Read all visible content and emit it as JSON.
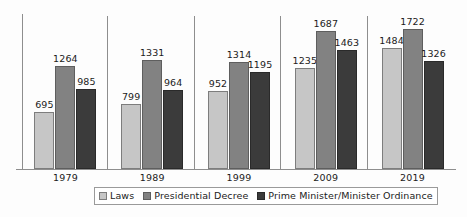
{
  "chart_data": {
    "type": "bar",
    "title": "",
    "subtitle": "",
    "xlabel": "",
    "ylabel": "",
    "categories": [
      "1979",
      "1989",
      "1999",
      "2009",
      "2019"
    ],
    "series": [
      {
        "name": "Laws",
        "color": "#c6c6c6",
        "values": [
          695,
          799,
          952,
          1235,
          1484
        ]
      },
      {
        "name": "Presidential Decree",
        "color": "#828282",
        "values": [
          1264,
          1331,
          1314,
          1687,
          1722
        ]
      },
      {
        "name": "Prime Minister/Minister Ordinance",
        "color": "#3b3b3b",
        "values": [
          985,
          964,
          1195,
          1463,
          1326
        ]
      }
    ],
    "data_labels": [
      [
        "695",
        "1264",
        "985"
      ],
      [
        "799",
        "1331",
        "964"
      ],
      [
        "952",
        "1314",
        "1195"
      ],
      [
        "1235",
        "1687",
        "1463"
      ],
      [
        "1484",
        "1722",
        "1326"
      ]
    ],
    "ylim": [
      0,
      1900
    ],
    "grid": false,
    "legend_position": "bottom",
    "show_y_axis_ticks": false
  },
  "legend": {
    "items": [
      {
        "label": "Laws",
        "swatch": "legend-swatch-laws"
      },
      {
        "label": "Presidential Decree",
        "swatch": "legend-swatch-presidential-decree"
      },
      {
        "label": "Prime Minister/Minister Ordinance",
        "swatch": "legend-swatch-pm-minister-ordinance"
      }
    ]
  },
  "axis": {
    "tick_labels": [
      "1979",
      "1989",
      "1999",
      "2009",
      "2019"
    ]
  },
  "caption": {
    "partial_text": ""
  }
}
